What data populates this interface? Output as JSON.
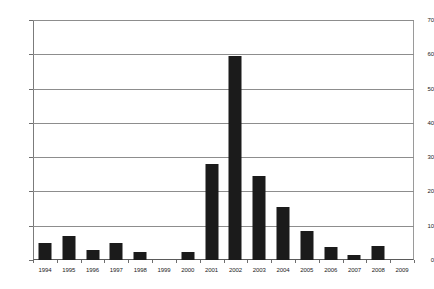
{
  "chart_data": {
    "type": "bar",
    "title": "",
    "subtitle": "",
    "xlabel": "",
    "ylabel": "",
    "ylim": [
      0,
      70
    ],
    "ytick_step": 10,
    "yticks": [
      "0",
      "10",
      "20",
      "30",
      "40",
      "50",
      "60",
      "70"
    ],
    "grid": true,
    "legend": false,
    "legend_position": "none",
    "bar_color": "#1b1b1b",
    "gridline_color": "#8d8d8d",
    "axis_color": "#5a5a5a",
    "categories": [
      "1994",
      "1995",
      "1996",
      "1997",
      "1998",
      "1999",
      "2000",
      "2001",
      "2002",
      "2003",
      "2004",
      "2005",
      "2006",
      "2007",
      "2008",
      "2009"
    ],
    "values": [
      5,
      7,
      3,
      5,
      2.3,
      0,
      2.3,
      28,
      59.5,
      24.5,
      15.5,
      8.5,
      3.8,
      1.5,
      4,
      0
    ]
  }
}
